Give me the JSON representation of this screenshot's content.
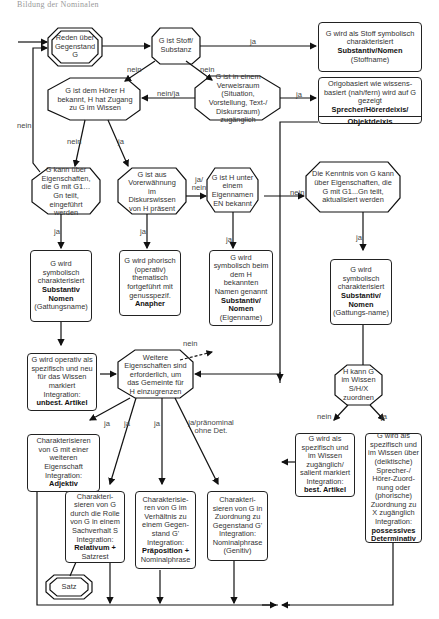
{
  "header": {
    "text": "Bildung der Nominalen"
  },
  "nodes": {
    "start": {
      "text": "Reden über Gegenstand G"
    },
    "stoff_q": {
      "text": "G ist Stoff/ Substanz"
    },
    "stoff_result": {
      "line1": "G wird als Stoff symbolisch charakterisiert",
      "bold": "Substantiv/Nomen",
      "line2": "(Stoffname)"
    },
    "hoerer_q": {
      "text": "G ist dem Hörer H bekannt, H hat Zugang zu G im Wissen"
    },
    "verweis_q": {
      "text": "G ist in einem Verweisraum (Situation, Vorstellung, Text-/ Diskursraum) zugänglich"
    },
    "deixis_result": {
      "line1": "Origobasiert wie wissens-basiert (nah/fern) wird auf G gezeigt",
      "bold": "Sprecher/Hörerdeixis/",
      "bottom": "Objektdeixis"
    },
    "eigenschaften_q": {
      "text": "G kann über Eigenschaften, die G mit G1…Gn teilt, eingeführt werden"
    },
    "vorerwaehnung_q": {
      "text": "G ist aus Vorerwähnung im Diskurswissen von H präsent"
    },
    "eigenname_q": {
      "text": "G ist H unter einem Eigennamen EN bekannt"
    },
    "kenntnis_q": {
      "text": "Die Kenntnis von G kann über Eigenschaften, die G mit G1...Gn teilt, aktualisiert werden"
    },
    "gattung_result": {
      "line1": "G wird symbolisch charakterisiert",
      "bold": "Substantiv Nomen",
      "line2": "(Gattungsname)"
    },
    "anapher_result": {
      "line1": "G wird phorisch (operativ) thematisch fortgeführt mit genusspezif.",
      "bold": "Anapher"
    },
    "eigenname_result": {
      "line1": "G wird symbolisch beim dem H bekannten Namen genannt",
      "bold": "Substantiv/ Nomen",
      "line2": "(Eigenname)"
    },
    "gattung2_result": {
      "line1": "G wird symbolisch charakterisiert",
      "bold": "Substantiv/ Nomen",
      "line2": "(Gattungs-name)"
    },
    "unbest_result": {
      "line1": "G wird operativ als spezifisch und neu für das Wissen markiert Integration:",
      "bold": "unbest. Artikel"
    },
    "weitere_q": {
      "text": "Weitere Eigenschaften sind erforderlich, um das Gemeinte für H einzugrenzen"
    },
    "zuordnen_q": {
      "text": "H kann G im Wissen S/H/X zuordnen"
    },
    "adjektiv_result": {
      "line1": "Charakterisieren von G mit einer weiteren Eigenschaft Integration:",
      "bold": "Adjektiv"
    },
    "relativum_result": {
      "line1": "Charakteri-sieren von G durch die Rolle von G in einem Sachverhalt S Integration:",
      "bold": "Relativum +",
      "line2": "Satzrest"
    },
    "praeposition_result": {
      "line1": "Charakterisie-ren von G im Verhältnis zu einem Gegen-stand G' Integration:",
      "bold": "Präposition +",
      "line2": "Nominalphrase"
    },
    "genitiv_result": {
      "line1": "Charakteri-sieren von G in Zuordnung zu Gegenstand G' Integration: Nominalphrase (Genitiv)"
    },
    "best_result": {
      "line1": "G wird als spezifisch und im Wissen zugänglich/ salient markiert Integration:",
      "bold": "best. Artikel"
    },
    "possessiv_result": {
      "line1": "G wird als spezifisch und im Wissen über (deiktische) Sprecher-/ Hörer-Zuord-nung oder (phorische) Zuordnung zu X zugänglich Integration:",
      "bold": "possessives Determinativ"
    },
    "satz": {
      "text": "Satz"
    }
  },
  "edge_labels": {
    "stoff_ja": "ja",
    "stoff_nein_left": "nein",
    "stoff_nein_right": "nein",
    "verweis_ja": "ja",
    "verweis_neinja": "nein/ja",
    "loop_nein": "nein",
    "hoerer_nein": "nein",
    "hoerer_ja": "ja",
    "vorerw_janein": "ja/ nein",
    "eigen_nein": "nein",
    "eig_ja": "ja",
    "vor_ja": "ja",
    "eigenname_ja": "ja",
    "kenntnis_ja": "ja",
    "weitere_nein": "nein",
    "w_ja1": "ja",
    "w_ja2": "ja",
    "w_ja3": "ja",
    "w_pran": "ja/pränominal ohne Det.",
    "zu_nein": "nein",
    "zu_ja": "ja"
  }
}
